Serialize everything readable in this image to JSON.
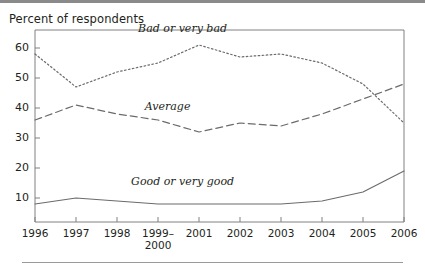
{
  "figure": {
    "axis_title": "Percent of respondents",
    "top_rule": true,
    "bottom_rule": true
  },
  "chart_data": {
    "type": "line",
    "title": "",
    "subtitle": "",
    "xlabel": "",
    "ylabel": "Percent of respondents",
    "categories": [
      "1996",
      "1997",
      "1998",
      "1999–2000",
      "2001",
      "2002",
      "2003",
      "2004",
      "2005",
      "2006"
    ],
    "x_tick_labels": [
      "1996",
      "1997",
      "1998",
      "1999–\n2000",
      "2001",
      "2002",
      "2003",
      "2004",
      "2005",
      "2006"
    ],
    "y_tick_labels": [
      "10",
      "20",
      "30",
      "40",
      "50",
      "60"
    ],
    "y_ticks": [
      10,
      20,
      30,
      40,
      50,
      60
    ],
    "ylim": [
      2,
      66
    ],
    "grid": false,
    "legend": "inline-annotations",
    "series": [
      {
        "name": "Bad or very bad",
        "style": "dotted",
        "color": "#6b6b6b",
        "label_x": 2000.0,
        "label_y": 66.0,
        "values": [
          58,
          47,
          52,
          55,
          61,
          57,
          58,
          55,
          48,
          35
        ]
      },
      {
        "name": "Average",
        "style": "dashed",
        "color": "#6b6b6b",
        "label_x": 1999.6,
        "label_y": 40.0,
        "values": [
          36,
          41,
          38,
          36,
          32,
          35,
          34,
          38,
          43,
          48
        ]
      },
      {
        "name": "Good or very good",
        "style": "solid",
        "color": "#6b6b6b",
        "label_x": 2000.0,
        "label_y": 15.0,
        "values": [
          8,
          10,
          9,
          8,
          8,
          8,
          8,
          9,
          12,
          19
        ]
      }
    ]
  }
}
